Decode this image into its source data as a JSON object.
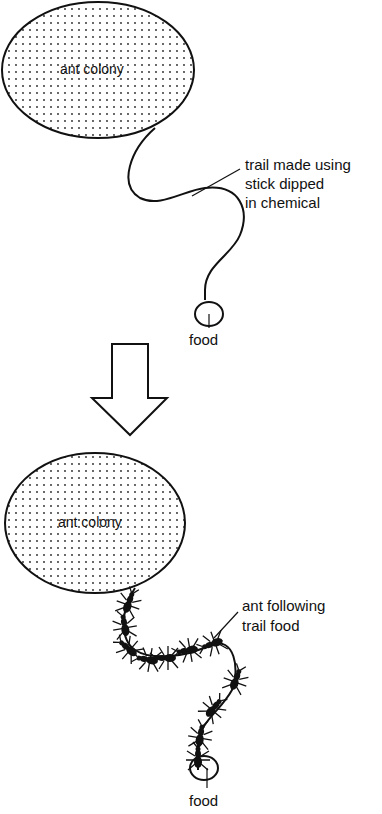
{
  "panel_before": {
    "colony_label": "ant colony",
    "trail_label_lines": [
      "trail made using",
      "stick dipped",
      "in chemical"
    ],
    "food_label": "food"
  },
  "arrow": {
    "direction": "down",
    "icon": "down-arrow-icon"
  },
  "panel_after": {
    "colony_label": "ant colony",
    "ants_label_lines": [
      "ant following",
      "trail food"
    ],
    "food_label": "food"
  }
}
